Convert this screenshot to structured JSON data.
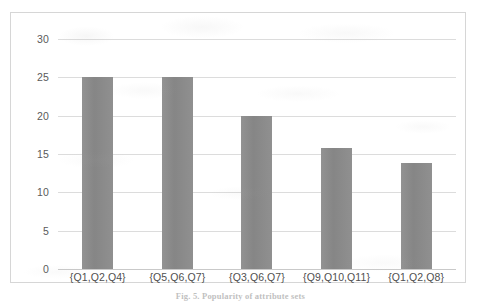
{
  "figure": {
    "caption": "Fig. 5. Popularity of attribute sets",
    "frame_border_color": "#d6d6d6",
    "background": "#ffffff"
  },
  "chart_data": {
    "type": "bar",
    "title": "",
    "subtitle": "",
    "xlabel": "",
    "ylabel": "",
    "categories": [
      "{Q1,Q2,Q4}",
      "{Q5,Q6,Q7}",
      "{Q3,Q6,Q7}",
      "{Q9,Q10,Q11}",
      "{Q1,Q2,Q8}"
    ],
    "values": [
      25,
      25,
      20,
      15.8,
      13.8
    ],
    "ylim": [
      0,
      30
    ],
    "yticks": [
      30,
      25,
      20,
      15,
      10,
      5,
      0
    ],
    "ytick_labels": [
      "30",
      "25",
      "20",
      "15",
      "10",
      "5",
      "0"
    ],
    "grid": true,
    "grid_axis": "y",
    "grid_color": "#dcdcdc",
    "legend": false,
    "legend_position": "none",
    "bar_color": "#8a8a8a",
    "annotations": []
  },
  "axis": {
    "tick_label_color": "#5a5a5a",
    "category_label_color": "#4f4f4f",
    "baseline_color": "#c9c9c9"
  }
}
